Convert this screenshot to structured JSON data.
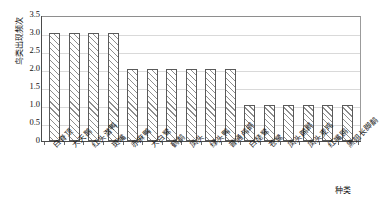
{
  "chart_data": {
    "type": "bar",
    "title": "",
    "xlabel": "种类",
    "ylabel": "鸟类出现频次",
    "ylim": [
      0,
      3.5
    ],
    "yticks": [
      "3.5",
      "3.0",
      "2.5",
      "2.0",
      "1.5",
      "1.0",
      "0.5",
      "0"
    ],
    "ytick_values": [
      3.5,
      3.0,
      2.5,
      2.0,
      1.5,
      1.0,
      0.5,
      0
    ],
    "grid": true,
    "legend": "none",
    "categories": [
      "白脊顶",
      "大天鹅",
      "红头潜鸭",
      "斑嘴",
      "赤麻鸭",
      "大白鹭",
      "鹤鹬",
      "凤头",
      "绿头鸭",
      "普通鸬鹚",
      "白琵鹭",
      "苍鹭",
      "凤头䴙䴘",
      "凤头麦鸡",
      "红嘴鸥",
      "黑翅长脚鹬"
    ],
    "values": [
      3,
      3,
      3,
      3,
      2,
      2,
      2,
      2,
      2,
      2,
      1,
      1,
      1,
      1,
      1,
      1
    ]
  },
  "style": {
    "bar_edge_color": "#5a5a5a",
    "bar_hatch_color": "#8d8d8d",
    "bar_face_color": "#ffffff",
    "grid_color": "#d9d9d9",
    "axis_color": "#4a4a4a",
    "plot_background": "#ffffff"
  }
}
